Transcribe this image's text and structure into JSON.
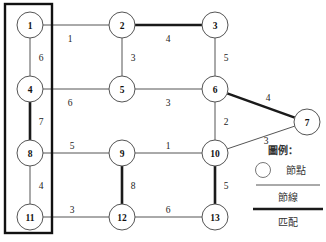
{
  "figure": {
    "type": "graph-diagram",
    "width": 326,
    "height": 242,
    "background": "#ffffff"
  },
  "nodes": [
    {
      "id": "1",
      "label": "1",
      "x": 30,
      "y": 25,
      "r": 13
    },
    {
      "id": "2",
      "label": "2",
      "x": 122,
      "y": 25,
      "r": 13
    },
    {
      "id": "3",
      "label": "3",
      "x": 215,
      "y": 25,
      "r": 13
    },
    {
      "id": "4",
      "label": "4",
      "x": 30,
      "y": 89,
      "r": 13
    },
    {
      "id": "5",
      "label": "5",
      "x": 122,
      "y": 89,
      "r": 13
    },
    {
      "id": "6",
      "label": "6",
      "x": 215,
      "y": 89,
      "r": 13
    },
    {
      "id": "7",
      "label": "7",
      "x": 307,
      "y": 122,
      "r": 13
    },
    {
      "id": "8",
      "label": "8",
      "x": 30,
      "y": 153,
      "r": 13
    },
    {
      "id": "9",
      "label": "9",
      "x": 122,
      "y": 153,
      "r": 13
    },
    {
      "id": "10",
      "label": "10",
      "x": 215,
      "y": 153,
      "r": 13
    },
    {
      "id": "11",
      "label": "11",
      "x": 30,
      "y": 217,
      "r": 13
    },
    {
      "id": "12",
      "label": "12",
      "x": 122,
      "y": 217,
      "r": 13
    },
    {
      "id": "13",
      "label": "13",
      "x": 215,
      "y": 217,
      "r": 13
    }
  ],
  "edges": [
    {
      "from": "1",
      "to": "2",
      "weight": "1",
      "matched": false,
      "lx": 70,
      "ly": 39
    },
    {
      "from": "2",
      "to": "3",
      "weight": "4",
      "matched": true,
      "lx": 168,
      "ly": 39
    },
    {
      "from": "1",
      "to": "4",
      "weight": "6",
      "matched": false,
      "lx": 41,
      "ly": 58
    },
    {
      "from": "2",
      "to": "5",
      "weight": "3",
      "matched": false,
      "lx": 133,
      "ly": 58
    },
    {
      "from": "3",
      "to": "6",
      "weight": "5",
      "matched": false,
      "lx": 226,
      "ly": 58
    },
    {
      "from": "4",
      "to": "5",
      "weight": "6",
      "matched": false,
      "lx": 70,
      "ly": 103
    },
    {
      "from": "5",
      "to": "6",
      "weight": "3",
      "matched": false,
      "lx": 168,
      "ly": 103
    },
    {
      "from": "6",
      "to": "7",
      "weight": "4",
      "matched": true,
      "lx": 268,
      "ly": 98
    },
    {
      "from": "4",
      "to": "8",
      "weight": "7",
      "matched": true,
      "lx": 41,
      "ly": 122
    },
    {
      "from": "6",
      "to": "10",
      "weight": "2",
      "matched": false,
      "lx": 226,
      "ly": 122
    },
    {
      "from": "7",
      "to": "10",
      "weight": "3",
      "matched": false,
      "lx": 266,
      "ly": 141
    },
    {
      "from": "8",
      "to": "9",
      "weight": "5",
      "matched": false,
      "lx": 72,
      "ly": 146
    },
    {
      "from": "9",
      "to": "10",
      "weight": "1",
      "matched": false,
      "lx": 168,
      "ly": 146
    },
    {
      "from": "8",
      "to": "11",
      "weight": "4",
      "matched": false,
      "lx": 41,
      "ly": 186
    },
    {
      "from": "9",
      "to": "12",
      "weight": "8",
      "matched": true,
      "lx": 133,
      "ly": 186
    },
    {
      "from": "10",
      "to": "13",
      "weight": "5",
      "matched": true,
      "lx": 226,
      "ly": 186
    },
    {
      "from": "11",
      "to": "12",
      "weight": "3",
      "matched": false,
      "lx": 72,
      "ly": 210
    },
    {
      "from": "12",
      "to": "13",
      "weight": "6",
      "matched": false,
      "lx": 168,
      "ly": 210
    }
  ],
  "group_box": {
    "name": "left-column-highlight-box",
    "x": 5,
    "y": 4,
    "width": 47,
    "height": 229,
    "members": [
      "1",
      "4",
      "8",
      "11"
    ]
  },
  "legend": {
    "title": "圖例：",
    "title_x": 283,
    "title_y": 150,
    "entries": [
      {
        "symbol": "circle",
        "label": "節點",
        "sx": 263,
        "sy": 170,
        "lx": 296,
        "ly": 170
      },
      {
        "symbol": "thin-line",
        "label": "節線",
        "lx": 288,
        "ly": 197
      },
      {
        "symbol": "thick-line",
        "label": "匹配",
        "lx": 288,
        "ly": 222
      }
    ],
    "rule_thin": {
      "x1": 256,
      "x2": 320,
      "y": 185
    },
    "rule_thick": {
      "x1": 253,
      "x2": 323,
      "y": 209
    }
  },
  "colors": {
    "edge_normal": "#555555",
    "edge_matched": "#1a1a1a",
    "node_stroke": "#555555",
    "node_fill": "#ffffff",
    "box_stroke": "#111111",
    "text": "#111111"
  }
}
